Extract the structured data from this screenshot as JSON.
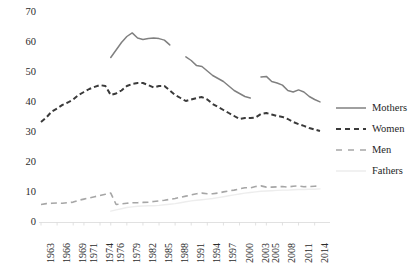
{
  "chart_data": {
    "type": "line",
    "title": "",
    "subtitle": "",
    "xlabel": "",
    "ylabel": "",
    "ylim": [
      0,
      70
    ],
    "yticks": [
      0,
      10,
      20,
      30,
      40,
      50,
      60,
      70
    ],
    "grid": false,
    "legend_position": "right",
    "categories": [
      "1963",
      "1966",
      "1969",
      "1971",
      "1974",
      "1976",
      "1979",
      "1982",
      "1985",
      "1988",
      "1991",
      "1994",
      "1997",
      "2000",
      "2003",
      "2005",
      "2008",
      "2011",
      "2014"
    ],
    "x_all": [
      1963,
      1964,
      1965,
      1966,
      1967,
      1968,
      1969,
      1970,
      1971,
      1972,
      1973,
      1974,
      1975,
      1976,
      1977,
      1978,
      1979,
      1980,
      1981,
      1982,
      1983,
      1984,
      1985,
      1986,
      1987,
      1988,
      1989,
      1990,
      1991,
      1992,
      1993,
      1994,
      1995,
      1996,
      1997,
      1998,
      1999,
      2000,
      2001,
      2002,
      2003,
      2004,
      2005,
      2006,
      2007,
      2008,
      2009,
      2010,
      2011,
      2012,
      2013,
      2014,
      2015
    ],
    "series": [
      {
        "name": "Mothers",
        "style": "solid",
        "color": "#808080",
        "segments": [
          {
            "x": [
              1976,
              1977,
              1978,
              1979,
              1980,
              1981,
              1982,
              1983,
              1984,
              1985,
              1986,
              1987
            ],
            "y": [
              55.0,
              57.5,
              60.0,
              62.0,
              63.2,
              61.5,
              61.0,
              61.3,
              61.5,
              61.3,
              60.8,
              59.2
            ]
          },
          {
            "x": [
              1990,
              1991,
              1992,
              1993,
              1994,
              1995,
              1996,
              1997,
              1998,
              1999,
              2000,
              2001,
              2002
            ],
            "y": [
              55.2,
              54.0,
              52.3,
              52.0,
              50.5,
              49.0,
              48.0,
              47.0,
              45.5,
              44.0,
              43.0,
              42.0,
              41.5
            ]
          },
          {
            "x": [
              2004,
              2005,
              2006,
              2007,
              2008,
              2009,
              2010,
              2011,
              2012,
              2013,
              2014,
              2015
            ],
            "y": [
              48.5,
              48.7,
              47.0,
              46.5,
              45.8,
              44.0,
              43.5,
              44.2,
              43.5,
              42.0,
              41.0,
              40.2
            ]
          }
        ]
      },
      {
        "name": "Women",
        "style": "dashed",
        "color": "#3a3a3a",
        "segments": [
          {
            "x": [
              1963,
              1964,
              1965,
              1966,
              1967,
              1968,
              1969,
              1970,
              1971,
              1972,
              1973,
              1974,
              1975,
              1976,
              1977,
              1978,
              1979,
              1980,
              1981,
              1982,
              1983,
              1984,
              1985,
              1986,
              1987,
              1988,
              1989,
              1990,
              1991,
              1992,
              1993,
              1994,
              1995,
              1996,
              1997,
              1998,
              1999,
              2000,
              2001,
              2002,
              2003,
              2004,
              2005,
              2006,
              2007,
              2008,
              2009,
              2010,
              2011,
              2012,
              2013,
              2014,
              2015
            ],
            "y": [
              33.5,
              35.0,
              37.0,
              38.0,
              39.2,
              40.0,
              41.0,
              42.5,
              43.5,
              44.5,
              45.2,
              45.8,
              45.5,
              42.5,
              43.0,
              44.0,
              45.5,
              46.2,
              46.5,
              46.5,
              45.8,
              45.0,
              45.5,
              45.5,
              44.0,
              42.5,
              41.5,
              40.5,
              41.0,
              41.5,
              41.8,
              41.0,
              39.5,
              38.5,
              37.5,
              36.5,
              35.5,
              34.5,
              34.8,
              34.8,
              35.0,
              36.2,
              36.5,
              36.0,
              35.5,
              35.2,
              34.5,
              33.5,
              32.8,
              32.2,
              31.5,
              31.0,
              30.5
            ]
          }
        ]
      },
      {
        "name": "Men",
        "style": "dashed-light",
        "color": "#a6a6a6",
        "segments": [
          {
            "x": [
              1963,
              1964,
              1965,
              1966,
              1967,
              1968,
              1969,
              1970,
              1971,
              1972,
              1973,
              1974,
              1975,
              1976,
              1977,
              1978,
              1979,
              1980,
              1981,
              1982,
              1983,
              1984,
              1985,
              1986,
              1987,
              1988,
              1989,
              1990,
              1991,
              1992,
              1993,
              1994,
              1995,
              1996,
              1997,
              1998,
              1999,
              2000,
              2001,
              2002,
              2003,
              2004,
              2005,
              2006,
              2007,
              2008,
              2009,
              2010,
              2011,
              2012,
              2013,
              2014,
              2015
            ],
            "y": [
              6.0,
              6.3,
              6.4,
              6.5,
              6.4,
              6.6,
              6.8,
              7.4,
              7.8,
              8.2,
              8.6,
              9.0,
              9.4,
              9.8,
              6.0,
              6.2,
              6.4,
              6.6,
              6.6,
              6.7,
              6.8,
              7.0,
              7.2,
              7.4,
              7.7,
              8.0,
              8.4,
              8.8,
              9.2,
              9.6,
              9.8,
              9.6,
              9.6,
              9.8,
              10.2,
              10.5,
              10.8,
              11.2,
              11.6,
              11.5,
              12.0,
              12.2,
              11.8,
              11.8,
              11.9,
              12.0,
              11.8,
              12.1,
              12.2,
              11.9,
              12.0,
              12.1,
              12.2
            ]
          }
        ]
      },
      {
        "name": "Fathers",
        "style": "solid-faint",
        "color": "#ededed",
        "segments": [
          {
            "x": [
              1976,
              1977,
              1978,
              1979,
              1980,
              1981,
              1982,
              1983,
              1984,
              1985,
              1986,
              1987,
              1988,
              1989,
              1990,
              1991,
              1992,
              1993,
              1994,
              1995,
              1996,
              1997,
              1998,
              1999,
              2000,
              2001,
              2002,
              2003,
              2004,
              2005,
              2006,
              2007,
              2008,
              2009,
              2010,
              2011,
              2012,
              2013,
              2014,
              2015
            ],
            "y": [
              3.8,
              4.2,
              4.6,
              5.0,
              5.2,
              5.4,
              5.5,
              5.6,
              5.6,
              5.7,
              5.9,
              6.1,
              6.3,
              6.6,
              6.9,
              7.2,
              7.4,
              7.6,
              7.8,
              8.0,
              8.3,
              8.6,
              8.9,
              9.2,
              9.5,
              9.8,
              10.0,
              10.2,
              10.4,
              10.5,
              10.6,
              10.7,
              10.8,
              10.8,
              10.9,
              11.0,
              11.0,
              11.1,
              11.1,
              11.2
            ]
          }
        ]
      }
    ],
    "legend_entries": [
      {
        "label": "Mothers",
        "style": "solid",
        "color": "#808080"
      },
      {
        "label": "Women",
        "style": "dashed",
        "color": "#3a3a3a"
      },
      {
        "label": "Men",
        "style": "dashed-light",
        "color": "#a6a6a6"
      },
      {
        "label": "Fathers",
        "style": "solid-faint",
        "color": "#ededed"
      }
    ]
  }
}
